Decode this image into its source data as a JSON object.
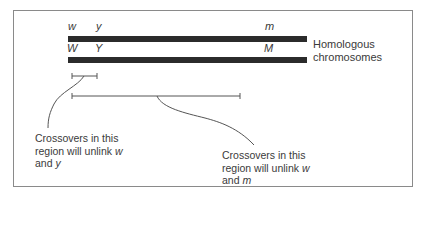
{
  "figure": {
    "chromosomes": {
      "label_line1": "Homologous",
      "label_line2": "chromosomes",
      "top_alleles": [
        {
          "name": "w",
          "x": 68
        },
        {
          "name": "y",
          "x": 96
        },
        {
          "name": "m",
          "x": 265
        }
      ],
      "bottom_alleles": [
        {
          "name": "W",
          "x": 67
        },
        {
          "name": "Y",
          "x": 95
        },
        {
          "name": "M",
          "x": 264
        }
      ]
    },
    "regions": [
      {
        "from": "w",
        "to": "y",
        "x1": 72,
        "x2": 97,
        "y": 76
      },
      {
        "from": "w",
        "to": "m",
        "x1": 72,
        "x2": 240,
        "y": 96
      }
    ],
    "annotations": [
      {
        "line1": "Crossovers in this",
        "line2_prefix": "region will unlink ",
        "line2_gene": "w",
        "line3_prefix": "and ",
        "line3_gene": "y"
      },
      {
        "line1": "Crossovers in this",
        "line2_prefix": "region will unlink ",
        "line2_gene": "w",
        "line3_prefix": "and ",
        "line3_gene": "m"
      }
    ],
    "colors": {
      "bar": "#2b2b2b",
      "line": "#555555",
      "text": "#3a3a3a",
      "frame": "#8a8a8a"
    }
  }
}
